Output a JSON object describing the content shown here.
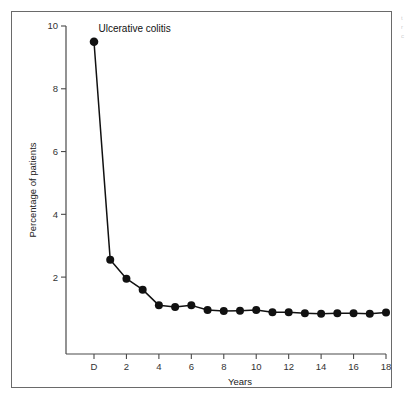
{
  "figure": {
    "panel_title": "Ulcerative colitis",
    "background_color": "#ffffff",
    "frame_color": "#6a6a6a",
    "series_color": "#111111"
  },
  "chart_data": {
    "type": "line",
    "title": "Ulcerative colitis",
    "xlabel": "Years",
    "ylabel": "Percentage of patients",
    "x": [
      "D",
      1,
      2,
      3,
      4,
      5,
      6,
      7,
      8,
      9,
      10,
      11,
      12,
      13,
      14,
      15,
      16,
      17,
      18
    ],
    "x_tick_labels": [
      "D",
      "2",
      "4",
      "6",
      "8",
      "10",
      "12",
      "14",
      "16",
      "18"
    ],
    "x_tick_values": [
      0,
      2,
      4,
      6,
      8,
      10,
      12,
      14,
      16,
      18
    ],
    "y_tick_labels": [
      "2",
      "4",
      "6",
      "8",
      "10"
    ],
    "y_tick_values": [
      2,
      4,
      6,
      8,
      10
    ],
    "values": [
      9.5,
      2.55,
      1.95,
      1.6,
      1.1,
      1.05,
      1.1,
      0.95,
      0.92,
      0.93,
      0.95,
      0.88,
      0.88,
      0.85,
      0.83,
      0.85,
      0.85,
      0.83,
      0.87
    ],
    "series": [
      {
        "name": "Ulcerative colitis",
        "values": [
          9.5,
          2.55,
          1.95,
          1.6,
          1.1,
          1.05,
          1.1,
          0.95,
          0.92,
          0.93,
          0.95,
          0.88,
          0.88,
          0.85,
          0.83,
          0.85,
          0.85,
          0.83,
          0.87
        ],
        "marker": "filled-circle",
        "color": "#111111"
      }
    ],
    "xlim": [
      0,
      18
    ],
    "ylim": [
      0,
      10
    ],
    "grid": false,
    "legend": false,
    "legend_position": "none",
    "annotations": [
      {
        "text": "Ulcerative colitis",
        "x": 0.4,
        "y": 10.0
      }
    ]
  },
  "edge_fragment": {
    "lines": [
      "t",
      "r",
      "c"
    ]
  }
}
